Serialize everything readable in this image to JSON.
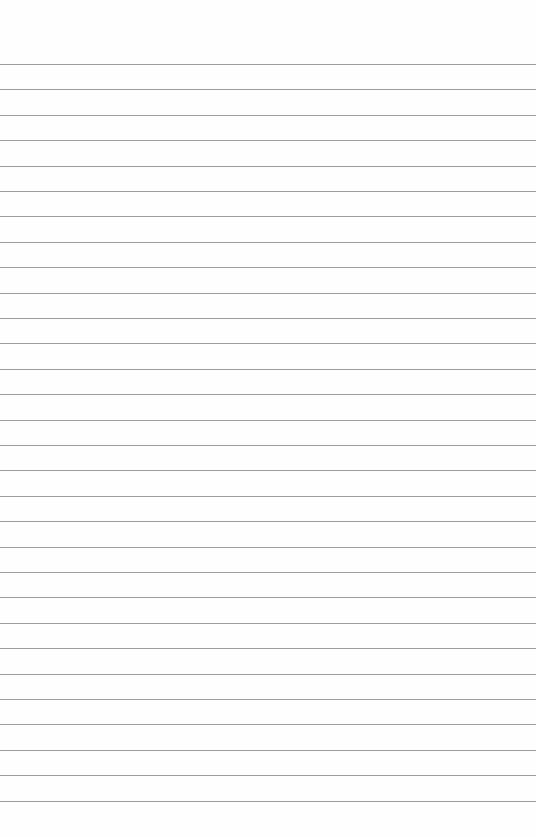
{
  "paper": {
    "type": "lined",
    "background_color": "#fefefe",
    "line_color": "#8c8c8c",
    "first_line_y": 64,
    "line_spacing": 25.4,
    "line_count": 30
  }
}
